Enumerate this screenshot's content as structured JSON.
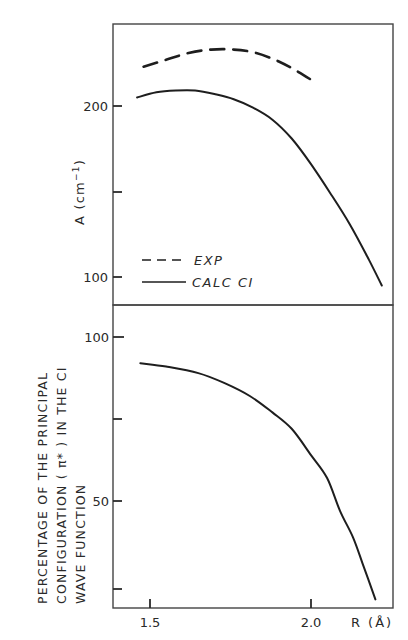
{
  "chart_data": [
    {
      "type": "line",
      "panel": "top",
      "title": "",
      "xlabel": "R (Å)",
      "ylabel": "A (cm⁻¹)",
      "xlim": [
        1.41,
        2.26
      ],
      "ylim": [
        87,
        248
      ],
      "yticks": [
        100,
        150,
        200
      ],
      "ytick_labels": [
        "100",
        "",
        "200"
      ],
      "grid": false,
      "legend_position": "lower-left",
      "series": [
        {
          "name": "EXP",
          "style": "dashed",
          "x": [
            1.48,
            1.55,
            1.62,
            1.69,
            1.76,
            1.83,
            1.9,
            1.96,
            2.02
          ],
          "y": [
            223,
            227,
            231,
            233,
            233,
            231,
            226,
            220,
            213
          ]
        },
        {
          "name": "CALC CI",
          "style": "solid",
          "x": [
            1.46,
            1.52,
            1.58,
            1.64,
            1.7,
            1.76,
            1.82,
            1.88,
            1.94,
            2.0,
            2.06,
            2.12,
            2.18,
            2.22
          ],
          "y": [
            205,
            208,
            209,
            209,
            207,
            204,
            199,
            192,
            181,
            166,
            149,
            131,
            110,
            95
          ]
        }
      ]
    },
    {
      "type": "line",
      "panel": "bottom",
      "title": "",
      "xlabel": "R (Å)",
      "ylabel": "PERCENTAGE OF THE PRINCIPAL CONFIGURATION (π*) IN THE CI WAVE FUNCTION",
      "xlim": [
        1.41,
        2.26
      ],
      "ylim": [
        17,
        110
      ],
      "yticks": [
        25,
        50,
        75,
        100
      ],
      "ytick_labels": [
        "",
        "50",
        "",
        "100"
      ],
      "xticks": [
        1.5,
        2.0
      ],
      "xtick_labels": [
        "1.5",
        "2.0"
      ],
      "grid": false,
      "series": [
        {
          "name": "CALC CI",
          "style": "solid",
          "x": [
            1.47,
            1.55,
            1.65,
            1.73,
            1.81,
            1.88,
            1.94,
            2.0,
            2.05,
            2.09,
            2.13,
            2.16,
            2.2
          ],
          "y": [
            92,
            91,
            89,
            86,
            82,
            77,
            72,
            64,
            57,
            47,
            39,
            31,
            20
          ]
        }
      ]
    }
  ],
  "labels": {
    "top_ylabel": "A (cm",
    "top_ylabel_sup": "−1",
    "top_ylabel_close": ")",
    "bottom_ylabel_line1": "PERCENTAGE  OF  THE  PRINCIPAL",
    "bottom_ylabel_line2": "CONFIGURATION ( π* ) IN  THE  CI",
    "bottom_ylabel_line3": "WAVE  FUNCTION",
    "xlabel": "R (Å)",
    "legend_exp": "EXP",
    "legend_calc": "CALC  CI",
    "top_tick_200": "200",
    "top_tick_100": "100",
    "bottom_tick_100": "100",
    "bottom_tick_50": "50",
    "x_tick_15": "1.5",
    "x_tick_20": "2.0"
  }
}
